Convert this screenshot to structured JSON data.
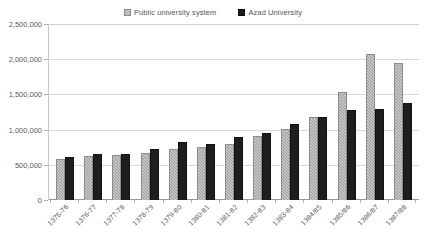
{
  "chart_data": {
    "type": "bar",
    "title": "",
    "xlabel": "",
    "ylabel": "",
    "ylim": [
      0,
      2500000
    ],
    "ytick_labels": [
      "2,500,000",
      "2,000,000",
      "1,500,000",
      "1,000,000",
      "500,000",
      "0"
    ],
    "ytick_values": [
      2500000,
      2000000,
      1500000,
      1000000,
      500000,
      0
    ],
    "grid": true,
    "legend_position": "top-center",
    "categories": [
      "1375-76",
      "1376-77",
      "1377-78",
      "1378-79",
      "1379-80",
      "1380-81",
      "1381-82",
      "1382-83",
      "1383-84",
      "1384/85",
      "1385/86",
      "1386/87",
      "1387/88"
    ],
    "series": [
      {
        "name": "Public university system",
        "color": "#9d9d9d",
        "values": [
          580000,
          620000,
          635000,
          670000,
          725000,
          755000,
          800000,
          915000,
          1010000,
          1180000,
          1530000,
          2075000,
          1945000
        ]
      },
      {
        "name": "Azad University",
        "color": "#1e1e1e",
        "values": [
          605000,
          650000,
          655000,
          720000,
          825000,
          795000,
          890000,
          955000,
          1085000,
          1180000,
          1275000,
          1290000,
          1380000
        ]
      }
    ]
  },
  "legend": {
    "entries": [
      {
        "label": "Public university system",
        "swatch": "public-series-swatch"
      },
      {
        "label": "Azad University",
        "swatch": "azad-series-swatch"
      }
    ]
  }
}
